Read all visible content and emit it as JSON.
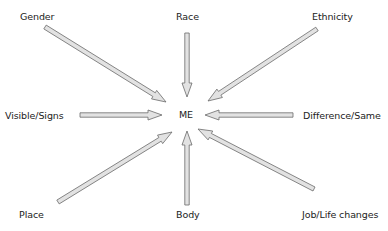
{
  "center": {
    "label": "ME",
    "x": 187,
    "y": 115
  },
  "nodes": [
    {
      "id": "gender",
      "label": "Gender",
      "x": 20,
      "y": 11
    },
    {
      "id": "race",
      "label": "Race",
      "x": 176,
      "y": 11
    },
    {
      "id": "ethnicity",
      "label": "Ethnicity",
      "x": 312,
      "y": 11
    },
    {
      "id": "visible-signs",
      "label": "Visible/Signs",
      "x": 5,
      "y": 110
    },
    {
      "id": "difference-same",
      "label": "Difference/Same",
      "x": 303,
      "y": 110
    },
    {
      "id": "place",
      "label": "Place",
      "x": 19,
      "y": 209
    },
    {
      "id": "body",
      "label": "Body",
      "x": 176,
      "y": 209
    },
    {
      "id": "job-life-changes",
      "label": "Job/Life changes",
      "x": 302,
      "y": 209
    }
  ],
  "arrows": [
    {
      "from": "gender",
      "x1": 45,
      "y1": 27,
      "x2": 166,
      "y2": 102
    },
    {
      "from": "race",
      "x1": 187,
      "y1": 33,
      "x2": 187,
      "y2": 97
    },
    {
      "from": "ethnicity",
      "x1": 317,
      "y1": 29,
      "x2": 208,
      "y2": 101
    },
    {
      "from": "visible-signs",
      "x1": 80,
      "y1": 115,
      "x2": 162,
      "y2": 115
    },
    {
      "from": "difference-same",
      "x1": 293,
      "y1": 115,
      "x2": 205,
      "y2": 115
    },
    {
      "from": "place",
      "x1": 58,
      "y1": 202,
      "x2": 172,
      "y2": 132
    },
    {
      "from": "body",
      "x1": 187,
      "y1": 205,
      "x2": 187,
      "y2": 131
    },
    {
      "from": "job-life-changes",
      "x1": 314,
      "y1": 189,
      "x2": 198,
      "y2": 129
    }
  ],
  "colors": {
    "arrow_fill": "#e2e2e2",
    "arrow_stroke": "#6a6a6a",
    "text": "#222222"
  }
}
